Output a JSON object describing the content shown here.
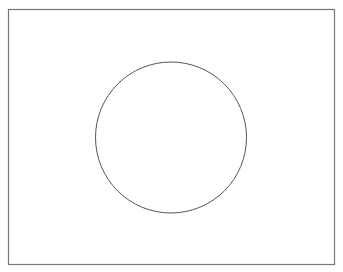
{
  "diagram": {
    "background_color": "#ffffff",
    "frame": {
      "shape": "rectangle",
      "stroke_color": "#777777",
      "fill_color": "none"
    },
    "shapes": [
      {
        "shape": "circle",
        "stroke_color": "#555555",
        "fill_color": "none"
      }
    ]
  }
}
